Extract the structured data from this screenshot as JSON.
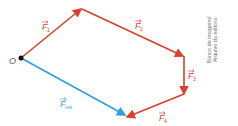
{
  "diagram": {
    "origin_label": "O",
    "colors": {
      "forces": "#d9412e",
      "resultant": "#2f9ee0",
      "origin": "#111111",
      "label_force": "#d9412e",
      "label_resultant": "#2f9ee0"
    },
    "vectors": [
      {
        "name": "F1",
        "letter": "F",
        "sub": "1"
      },
      {
        "name": "F2",
        "letter": "F",
        "sub": "2"
      },
      {
        "name": "F3",
        "letter": "F",
        "sub": "3"
      },
      {
        "name": "F4",
        "letter": "F",
        "sub": "4"
      },
      {
        "name": "Fres",
        "letter": "F",
        "sub": "res"
      }
    ],
    "credit_line1": "Banco de imagens/",
    "credit_line2": "Arquivo da editora"
  }
}
